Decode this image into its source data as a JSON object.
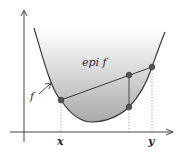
{
  "diagram": {
    "colors": {
      "axis": "#444444",
      "curve": "#3a3a3a",
      "fill_top": "#ffffff",
      "fill_bottom": "#a9a9a9",
      "point": "#555555",
      "dotted": "#9a9a9a",
      "text": "#2a2a2a"
    },
    "labels": {
      "epigraph": "epi f",
      "function": "f",
      "x_point": "x",
      "y_point": "y"
    },
    "points": [
      {
        "name": "f(x)",
        "cx": 61,
        "cy": 100
      },
      {
        "name": "f(y)",
        "cx": 152,
        "cy": 67
      },
      {
        "name": "chord-point",
        "cx": 129,
        "cy": 75
      },
      {
        "name": "curve-point",
        "cx": 129,
        "cy": 107
      }
    ]
  }
}
